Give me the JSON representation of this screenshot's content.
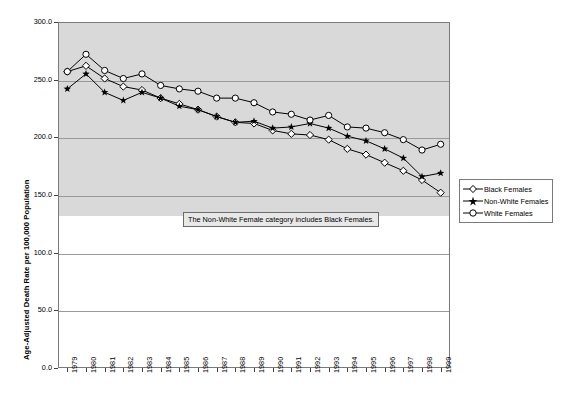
{
  "chart_data": {
    "type": "line",
    "title": "",
    "xlabel": "",
    "ylabel": "Age-Adjusted Death Rate per 100,000 Population",
    "ylim": [
      0,
      300
    ],
    "ytick_labels": [
      "300.0",
      "250.0",
      "200.0",
      "150.0",
      "100.0",
      "50.0",
      "0.0"
    ],
    "ytick_values": [
      300,
      250,
      200,
      150,
      100,
      50,
      0
    ],
    "grid": true,
    "legend_position": "right",
    "categories": [
      "1979",
      "1980",
      "1981",
      "1982",
      "1983",
      "1984",
      "1985",
      "1986",
      "1987",
      "1988",
      "1989",
      "1990",
      "1991",
      "1992",
      "1993",
      "1994",
      "1995",
      "1996",
      "1997",
      "1998",
      "1999"
    ],
    "x": [
      1979,
      1980,
      1981,
      1982,
      1983,
      1984,
      1985,
      1986,
      1987,
      1988,
      1989,
      1990,
      1991,
      1992,
      1993,
      1994,
      1995,
      1996,
      1997,
      1998,
      1999
    ],
    "series": [
      {
        "name": "Black Females",
        "marker": "open-diamond",
        "values": [
          257.0,
          262.0,
          251.0,
          244.0,
          241.0,
          234.0,
          229.0,
          224.0,
          218.0,
          213.0,
          212.0,
          206.0,
          203.0,
          202.0,
          198.0,
          190.0,
          185.0,
          178.0,
          171.0,
          163.0,
          152.0
        ]
      },
      {
        "name": "Non-White Females",
        "marker": "filled-star",
        "values": [
          242.0,
          255.0,
          239.0,
          232.0,
          239.0,
          234.0,
          227.0,
          224.0,
          218.0,
          213.0,
          214.0,
          208.0,
          209.0,
          212.0,
          208.0,
          201.0,
          197.0,
          190.0,
          182.0,
          166.0,
          169.0
        ]
      },
      {
        "name": "White Females",
        "marker": "open-circle",
        "values": [
          257.0,
          272.0,
          258.0,
          251.0,
          255.0,
          245.0,
          242.0,
          240.0,
          234.0,
          234.0,
          230.0,
          222.0,
          220.0,
          215.0,
          219.0,
          209.0,
          208.0,
          204.0,
          198.0,
          189.0,
          194.0
        ]
      }
    ],
    "annotation": "The Non-White Female category includes Black Females."
  },
  "legend": {
    "items": [
      {
        "label": "Black Females"
      },
      {
        "label": "Non-White Females"
      },
      {
        "label": "White Females"
      }
    ]
  },
  "colors": {
    "plot_background_upper": "#d9d9d9",
    "plot_background_lower": "#ffffff",
    "gridline": "#9a9a9a",
    "series_line": "#000000",
    "frame": "#7a7a7a"
  }
}
